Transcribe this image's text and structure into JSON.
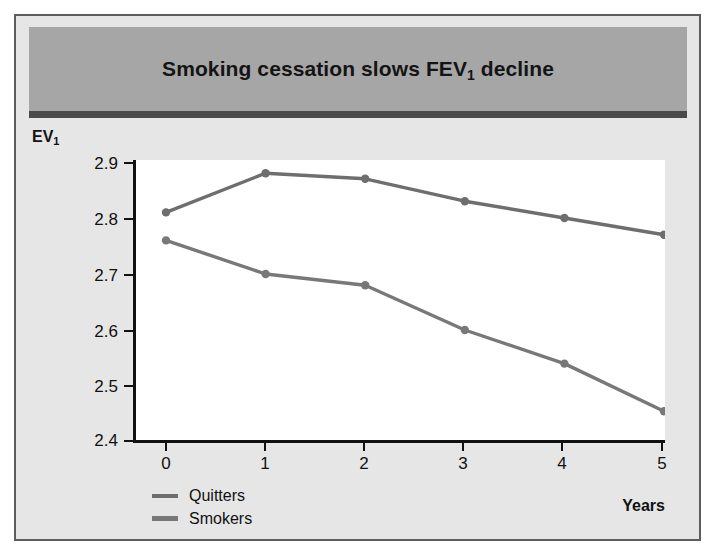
{
  "figure": {
    "title_prefix": "Smoking cessation slows FEV",
    "title_sub": "1",
    "title_suffix": " decline",
    "border_color": "#5d5d5d",
    "band_color": "#a6a6a6",
    "rule_color": "#4a4a4a",
    "background_color": "#e6e6e6",
    "canvas_color": "#ffffff"
  },
  "axes": {
    "y_label_prefix": "EV",
    "y_label_sub": "1",
    "x_label": "Years",
    "y_ticks": [
      "2.9",
      "2.8",
      "2.7",
      "2.6",
      "2.5",
      "2.4"
    ],
    "x_ticks": [
      "0",
      "1",
      "2",
      "3",
      "4",
      "5"
    ]
  },
  "legend": {
    "position": "bottom-left",
    "items": [
      {
        "label": "Quitters",
        "color": "#6e6e6e"
      },
      {
        "label": "Smokers",
        "color": "#787878"
      }
    ]
  },
  "chart_data": {
    "type": "line",
    "title": "Smoking cessation slows FEV1 decline",
    "xlabel": "Years",
    "ylabel": "FEV1",
    "x": [
      0,
      1,
      2,
      3,
      4,
      5
    ],
    "xlim": [
      0,
      5
    ],
    "ylim": [
      2.4,
      2.9
    ],
    "grid": false,
    "legend_position": "bottom-left",
    "series": [
      {
        "name": "Quitters",
        "color": "#6e6e6e",
        "marker": "circle",
        "values": [
          2.81,
          2.88,
          2.87,
          2.83,
          2.8,
          2.77
        ]
      },
      {
        "name": "Smokers",
        "color": "#787878",
        "marker": "circle",
        "values": [
          2.76,
          2.7,
          2.68,
          2.6,
          2.54,
          2.455
        ]
      }
    ]
  }
}
